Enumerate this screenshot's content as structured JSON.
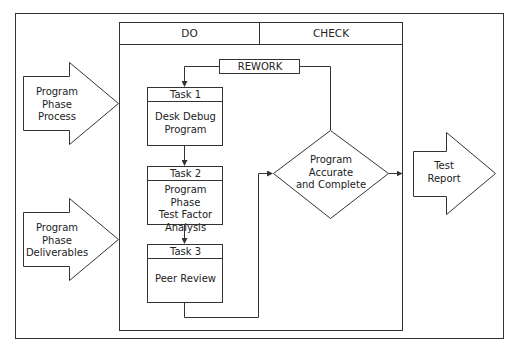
{
  "diagram": {
    "type": "process-flow",
    "columns": {
      "do": "DO",
      "check": "CHECK"
    },
    "inputs": [
      {
        "id": "input-process",
        "label": "Program\nPhase\nProcess",
        "lines": [
          "Program",
          "Phase",
          "Process"
        ]
      },
      {
        "id": "input-deliverables",
        "label": "Program\nPhase\nDeliverables",
        "lines": [
          "Program",
          "Phase",
          "Deliverables"
        ]
      }
    ],
    "tasks": [
      {
        "title": "Task 1",
        "lines": [
          "Desk Debug",
          "Program"
        ]
      },
      {
        "title": "Task 2",
        "lines": [
          "Program Phase",
          "Test Factor",
          "Analysis"
        ]
      },
      {
        "title": "Task 3",
        "lines": [
          "Peer Review"
        ]
      }
    ],
    "rework": {
      "label": "REWORK"
    },
    "decision": {
      "lines": [
        "Program",
        "Accurate",
        "and Complete"
      ]
    },
    "output": {
      "lines": [
        "Test",
        "Report"
      ]
    },
    "edges": [
      {
        "from": "REWORK",
        "to": "Task 1"
      },
      {
        "from": "Task 1",
        "to": "Task 2"
      },
      {
        "from": "Task 2",
        "to": "Task 3"
      },
      {
        "from": "Task 3",
        "to": "Program Accurate and Complete"
      },
      {
        "from": "Program Accurate and Complete",
        "to": "REWORK"
      },
      {
        "from": "Program Accurate and Complete",
        "to": "Test Report"
      }
    ],
    "colors": {
      "stroke": "#333333",
      "background": "#ffffff",
      "text": "#222222"
    }
  }
}
